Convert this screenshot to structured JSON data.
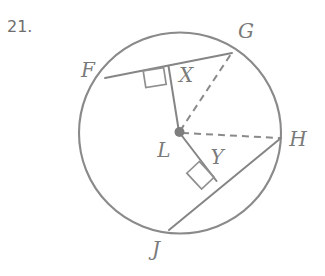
{
  "problem": {
    "number": "21."
  },
  "figure": {
    "type": "circle-diagram",
    "stroke_color": "#858585",
    "background_color": "#ffffff",
    "circle": {
      "center_label": "L",
      "cx": 180,
      "cy": 133,
      "r": 101
    },
    "points": [
      {
        "label": "F",
        "x": 105,
        "y": 78,
        "label_x": 88,
        "label_y": 71
      },
      {
        "label": "G",
        "x": 232,
        "y": 53,
        "label_x": 246,
        "label_y": 32
      },
      {
        "label": "H",
        "x": 281,
        "y": 138,
        "label_x": 298,
        "label_y": 140
      },
      {
        "label": "J",
        "x": 169,
        "y": 230,
        "label_x": 156,
        "label_y": 250
      },
      {
        "label": "L",
        "x": 179,
        "y": 132,
        "label_x": 164,
        "label_y": 151
      },
      {
        "label": "X",
        "x": 168,
        "y": 66,
        "label_x": 186,
        "label_y": 76
      },
      {
        "label": "Y",
        "x": 215,
        "y": 180,
        "label_x": 217,
        "label_y": 158
      }
    ],
    "chords": [
      {
        "name": "chord-FG",
        "from": "F",
        "to": "G",
        "style": "solid"
      },
      {
        "name": "chord-JH",
        "from": "J",
        "to": "H",
        "style": "solid"
      }
    ],
    "segments": [
      {
        "name": "segment-LX",
        "from": "L",
        "to": "X",
        "style": "solid"
      },
      {
        "name": "segment-LY",
        "from": "L",
        "to": "Y",
        "style": "solid"
      }
    ],
    "radii": [
      {
        "name": "radius-LG",
        "from": "L",
        "to": "G",
        "style": "dashed"
      },
      {
        "name": "radius-LH",
        "from": "L",
        "to": "H",
        "style": "dashed"
      }
    ],
    "right_angles": [
      {
        "name": "right-angle-at-X",
        "at": "X"
      },
      {
        "name": "right-angle-at-Y",
        "at": "Y"
      }
    ]
  }
}
